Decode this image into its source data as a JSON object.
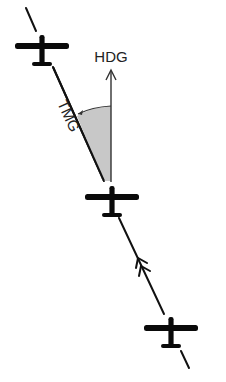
{
  "diagram": {
    "labels": {
      "heading": "HDG",
      "track": "TMG"
    },
    "colors": {
      "line": "#111111",
      "aircraft": "#0a0a0a",
      "angle_fill": "#c8c8c8",
      "text": "#222222",
      "background": "#ffffff"
    },
    "aircraft": [
      {
        "id": "aircraft-top",
        "x": 42,
        "y": 46
      },
      {
        "id": "aircraft-middle",
        "x": 112,
        "y": 197
      },
      {
        "id": "aircraft-bottom",
        "x": 171,
        "y": 328
      }
    ],
    "track_direction_marker": "double-chevron-arrow"
  }
}
